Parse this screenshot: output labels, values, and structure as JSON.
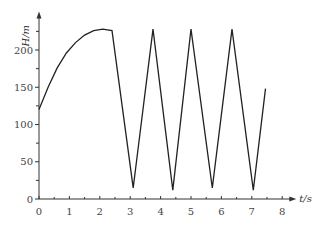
{
  "chart_data": {
    "type": "line",
    "title": "",
    "xlabel": "t/s",
    "ylabel": "H/m",
    "xlim": [
      0,
      8
    ],
    "ylim": [
      0,
      240
    ],
    "x_ticks": [
      0,
      1,
      2,
      3,
      4,
      5,
      6,
      7,
      8
    ],
    "y_ticks": [
      0,
      50,
      100,
      150,
      200
    ],
    "grid": false,
    "legend": null,
    "series": [
      {
        "name": "H",
        "points": [
          [
            0,
            120
          ],
          [
            0.3,
            150
          ],
          [
            0.6,
            176
          ],
          [
            0.9,
            196
          ],
          [
            1.2,
            210
          ],
          [
            1.5,
            220
          ],
          [
            1.8,
            226
          ],
          [
            2.1,
            228
          ],
          [
            2.4,
            226
          ],
          [
            3.1,
            15
          ],
          [
            3.75,
            228
          ],
          [
            4.4,
            12
          ],
          [
            5.0,
            228
          ],
          [
            5.7,
            15
          ],
          [
            6.35,
            228
          ],
          [
            7.05,
            12
          ],
          [
            7.45,
            148
          ]
        ]
      }
    ]
  },
  "labels": {
    "xlabel": "t/s",
    "ylabel": "H/m",
    "x_ticks": [
      "0",
      "1",
      "2",
      "3",
      "4",
      "5",
      "6",
      "7",
      "8"
    ],
    "y_ticks": [
      "0",
      "50",
      "100",
      "150",
      "200"
    ]
  }
}
